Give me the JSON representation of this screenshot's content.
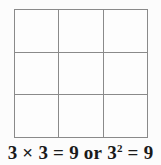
{
  "figure": {
    "type": "grid-diagram",
    "background_color": "#fcfcfc",
    "grid": {
      "rows": 3,
      "columns": 3,
      "total_cells": 9,
      "line_color": "#8a8a8a",
      "fill_color": "#fdfdfd",
      "cells": [
        {
          "row": 1,
          "col": 1,
          "label": ""
        },
        {
          "row": 1,
          "col": 2,
          "label": ""
        },
        {
          "row": 1,
          "col": 3,
          "label": ""
        },
        {
          "row": 2,
          "col": 1,
          "label": ""
        },
        {
          "row": 2,
          "col": 2,
          "label": ""
        },
        {
          "row": 2,
          "col": 3,
          "label": ""
        },
        {
          "row": 3,
          "col": 1,
          "label": ""
        },
        {
          "row": 3,
          "col": 2,
          "label": ""
        },
        {
          "row": 3,
          "col": 3,
          "label": ""
        }
      ]
    },
    "caption": {
      "full_text": "3 × 3 = 9 or 3² = 9",
      "text_color": "#1a1a1a",
      "parts": {
        "factor_a": "3",
        "multiply_sign": "×",
        "factor_b": "3",
        "equals_a": "=",
        "product_a": "9",
        "conjunction": "or",
        "base": "3",
        "exponent": "2",
        "equals_b": "=",
        "product_b": "9"
      }
    }
  }
}
